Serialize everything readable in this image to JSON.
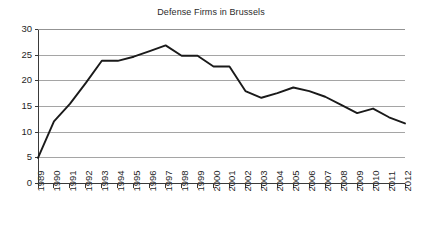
{
  "chart_data": {
    "type": "line",
    "title": "Defense Firms in Brussels",
    "xlabel": "",
    "ylabel": "",
    "ylim": [
      0,
      30
    ],
    "yticks": [
      0,
      5,
      10,
      15,
      20,
      25,
      30
    ],
    "ytick_labels": [
      "0",
      "5",
      "10",
      "15",
      "20",
      "25",
      "30"
    ],
    "grid": true,
    "legend": "none",
    "categories": [
      "1989",
      "1990",
      "1991",
      "1992",
      "1993",
      "1994",
      "1995",
      "1996",
      "1997",
      "1998",
      "1999",
      "2000",
      "2001",
      "2002",
      "2003",
      "2004",
      "2005",
      "2006",
      "2007",
      "2008",
      "2009",
      "2010",
      "2011",
      "2012"
    ],
    "series": [
      {
        "name": "Defense Firms",
        "color": "#1a1a1a",
        "values": [
          5.0,
          12.1,
          15.5,
          19.6,
          23.9,
          23.9,
          24.7,
          25.8,
          26.9,
          24.9,
          24.9,
          22.8,
          22.8,
          18.0,
          16.7,
          17.6,
          18.7,
          18.0,
          16.9,
          15.3,
          13.7,
          14.6,
          12.9,
          11.7
        ]
      }
    ]
  },
  "axes": {
    "y_axis_name": "y-axis",
    "x_axis_name": "x-axis"
  }
}
